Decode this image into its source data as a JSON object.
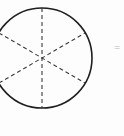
{
  "figure": {
    "type": "geometry-diagram",
    "background_color": "#fdfdfd",
    "stroke_color": "#1f1f1f",
    "dash_color": "#3a3a3a",
    "canvas": {
      "width": 124,
      "height": 136
    },
    "circle": {
      "center_x": 42,
      "center_y": 58,
      "radius": 50,
      "stroke_width": 1.6,
      "fill": "none",
      "clipped_left_edge": true
    },
    "diameters": [
      {
        "name": "vertical-diameter",
        "angle_degrees": 90,
        "x1": 42,
        "y1": 8,
        "x2": 42,
        "y2": 108,
        "dash_pattern": "4 3"
      },
      {
        "name": "diagonal-diameter-upper-left-to-lower-right",
        "angle_degrees": 150,
        "x1": -1,
        "y1": 33,
        "x2": 85,
        "y2": 83,
        "dash_pattern": "4 3"
      },
      {
        "name": "diagonal-diameter-lower-left-to-upper-right",
        "angle_degrees": 30,
        "x1": -1,
        "y1": 83,
        "x2": 85,
        "y2": 33,
        "dash_pattern": "4 3"
      }
    ],
    "sector_count": 6,
    "sector_angle_degrees": 60,
    "annotations": [
      {
        "name": "equals-sign-fragment",
        "text": "=",
        "x": 116,
        "y": 46,
        "color": "#b8b8b8",
        "clipped_right_edge": true
      }
    ]
  }
}
